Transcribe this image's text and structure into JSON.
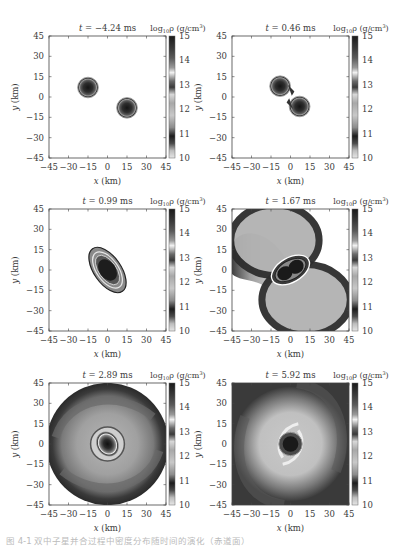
{
  "chart_data": [
    {
      "type": "heatmap",
      "title": "t = −4.24 ms",
      "time_ms": -4.24,
      "morphology": "two separate stars",
      "xlabel": "x (km)",
      "ylabel": "y (km)",
      "xlim": [
        -45,
        45
      ],
      "ylim": [
        -45,
        45
      ],
      "xticks": [
        -45,
        -30,
        -15,
        0,
        15,
        30,
        45
      ],
      "yticks": [
        -45,
        -30,
        -15,
        0,
        15,
        30,
        45
      ],
      "colorbar": {
        "label": "log10 ρ (g/cm³)",
        "range": [
          10,
          15
        ],
        "ticks": [
          10,
          11,
          12,
          13,
          14,
          15
        ]
      },
      "features": [
        {
          "kind": "star",
          "center": [
            -15,
            7
          ],
          "radius_km": 8
        },
        {
          "kind": "star",
          "center": [
            15,
            -8
          ],
          "radius_km": 8
        }
      ]
    },
    {
      "type": "heatmap",
      "title": "t = 0.46 ms",
      "time_ms": 0.46,
      "morphology": "merging binary",
      "xlabel": "x (km)",
      "ylabel": "y (km)",
      "xlim": [
        -45,
        45
      ],
      "ylim": [
        -45,
        45
      ],
      "xticks": [
        -45,
        -30,
        -15,
        0,
        15,
        30,
        45
      ],
      "yticks": [
        -45,
        -30,
        -15,
        0,
        15,
        30,
        45
      ],
      "colorbar": {
        "label": "log10 ρ (g/cm³)",
        "range": [
          10,
          15
        ],
        "ticks": [
          10,
          11,
          12,
          13,
          14,
          15
        ]
      },
      "features": [
        {
          "kind": "star",
          "center": [
            -8,
            8
          ],
          "radius_km": 8
        },
        {
          "kind": "star",
          "center": [
            7,
            -7
          ],
          "radius_km": 8
        }
      ]
    },
    {
      "type": "heatmap",
      "title": "t = 0.99 ms",
      "time_ms": 0.99,
      "morphology": "elongated merger remnant",
      "xlabel": "x (km)",
      "ylabel": "y (km)",
      "xlim": [
        -45,
        45
      ],
      "ylim": [
        -45,
        45
      ],
      "xticks": [
        -45,
        -30,
        -15,
        0,
        15,
        30,
        45
      ],
      "yticks": [
        -45,
        -30,
        -15,
        0,
        15,
        30,
        45
      ],
      "colorbar": {
        "label": "log10 ρ (g/cm³)",
        "range": [
          10,
          15
        ],
        "ticks": [
          10,
          11,
          12,
          13,
          14,
          15
        ]
      },
      "features": [
        {
          "kind": "remnant",
          "center": [
            0,
            0
          ],
          "radius_km": 18
        }
      ]
    },
    {
      "type": "heatmap",
      "title": "t = 1.67 ms",
      "time_ms": 1.67,
      "morphology": "remnant with two tidal spiral arms",
      "xlabel": "x (km)",
      "ylabel": "y (km)",
      "xlim": [
        -45,
        45
      ],
      "ylim": [
        -45,
        45
      ],
      "xticks": [
        -45,
        -30,
        -15,
        0,
        15,
        30,
        45
      ],
      "yticks": [
        -45,
        -30,
        -15,
        0,
        15,
        30,
        45
      ],
      "colorbar": {
        "label": "log10 ρ (g/cm³)",
        "range": [
          10,
          15
        ],
        "ticks": [
          10,
          11,
          12,
          13,
          14,
          15
        ]
      },
      "features": [
        {
          "kind": "remnant",
          "center": [
            0,
            0
          ],
          "radius_km": 12
        },
        {
          "kind": "spiral-arms",
          "count": 2
        }
      ]
    },
    {
      "type": "heatmap",
      "title": "t = 2.89 ms",
      "time_ms": 2.89,
      "morphology": "remnant with surrounding disk",
      "xlabel": "x (km)",
      "ylabel": "y (km)",
      "xlim": [
        -45,
        45
      ],
      "ylim": [
        -45,
        45
      ],
      "xticks": [
        -45,
        -30,
        -15,
        0,
        15,
        30,
        45
      ],
      "yticks": [
        -45,
        -30,
        -15,
        0,
        15,
        30,
        45
      ],
      "colorbar": {
        "label": "log10 ρ (g/cm³)",
        "range": [
          10,
          15
        ],
        "ticks": [
          10,
          11,
          12,
          13,
          14,
          15
        ]
      },
      "features": [
        {
          "kind": "remnant",
          "center": [
            0,
            0
          ],
          "radius_km": 10
        },
        {
          "kind": "disk",
          "radius_km": 45
        }
      ]
    },
    {
      "type": "heatmap",
      "title": "t = 5.92 ms",
      "time_ms": 5.92,
      "morphology": "differentially rotating remnant with spiral disk",
      "xlabel": "x (km)",
      "ylabel": "y (km)",
      "xlim": [
        -45,
        45
      ],
      "ylim": [
        -45,
        45
      ],
      "xticks": [
        -45,
        -30,
        -15,
        0,
        15,
        30,
        45
      ],
      "yticks": [
        -45,
        -30,
        -15,
        0,
        15,
        30,
        45
      ],
      "colorbar": {
        "label": "log10 ρ (g/cm³)",
        "range": [
          10,
          15
        ],
        "ticks": [
          10,
          11,
          12,
          13,
          14,
          15
        ]
      },
      "features": [
        {
          "kind": "remnant",
          "center": [
            0,
            0
          ],
          "radius_km": 10
        },
        {
          "kind": "spiral-disk",
          "radius_km": 45
        }
      ]
    }
  ],
  "labels": {
    "t_prefix": "t",
    "equals": " = ",
    "unit_ms": " ms",
    "cb_log": "log",
    "cb_sub": "10",
    "cb_rho": "ρ (g/cm",
    "cb_sup": "3",
    "cb_close": ")",
    "x_var": "x",
    "y_var": "y",
    "km": " (km)"
  },
  "caption": "图 4-1  双中子星并合过程中密度分布随时间的演化（赤道面）"
}
